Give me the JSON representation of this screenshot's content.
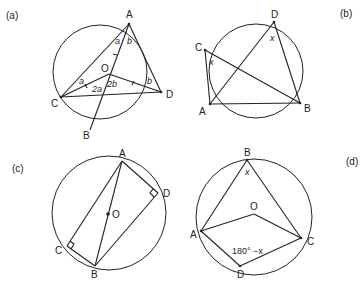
{
  "panels": [
    {
      "id": "a",
      "label": "(a)",
      "points": {
        "A": "A",
        "B": "B",
        "C": "C",
        "D": "D",
        "O": "O"
      },
      "angles": {
        "a_top": "a",
        "b_top": "b",
        "a_left": "a",
        "b_right": "b",
        "two_a": "2a",
        "two_b": "2b"
      }
    },
    {
      "id": "b",
      "label": "(b)",
      "points": {
        "A": "A",
        "B": "B",
        "C": "C",
        "D": "D"
      },
      "angles": {
        "x_c": "x",
        "x_d": "x"
      }
    },
    {
      "id": "c",
      "label": "(c)",
      "points": {
        "A": "A",
        "B": "B",
        "C": "C",
        "D": "D",
        "O": "O"
      }
    },
    {
      "id": "d",
      "label": "(d)",
      "points": {
        "A": "A",
        "B": "B",
        "C": "C",
        "D": "D",
        "O": "O"
      },
      "angles": {
        "x_b": "x",
        "d_angle": "180° −x"
      }
    }
  ],
  "colors": {
    "ink": "#222222",
    "background": "#ffffff"
  }
}
